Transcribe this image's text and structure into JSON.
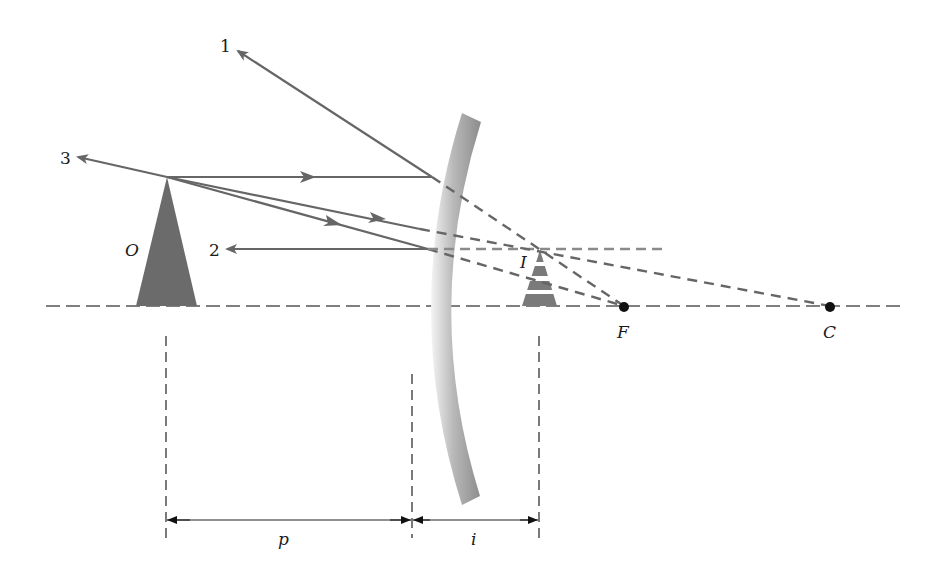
{
  "diagram": {
    "type": "convex-mirror-ray-diagram",
    "colors": {
      "ray": "#666666",
      "ray_dashed": "#666666",
      "ray2_extension": "#8a8a8a",
      "axis": "#555555",
      "object_fill": "#6b6b6b",
      "image_fill": "#7a7a7a",
      "mirror_light": "#f2f2f2",
      "mirror_dark": "#9a9a9a",
      "point": "#111111",
      "dimension": "#222222"
    },
    "labels": {
      "object": "O",
      "image": "I",
      "focal_point": "F",
      "center_of_curvature": "C",
      "ray1": "1",
      "ray2": "2",
      "ray3": "3",
      "object_distance": "p",
      "image_distance": "i"
    },
    "points": {
      "object_apex": [
        167,
        177
      ],
      "object_base": [
        [
          136,
          306
        ],
        [
          197,
          306
        ]
      ],
      "image_apex": [
        540,
        249
      ],
      "image_base": [
        [
          522,
          306
        ],
        [
          557,
          306
        ]
      ],
      "F": [
        624,
        307
      ],
      "C": [
        830,
        307
      ],
      "mirror_vertex_x": 412
    }
  }
}
